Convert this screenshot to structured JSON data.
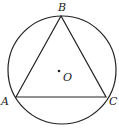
{
  "diagram": {
    "type": "triangle-inscribed-in-circle",
    "circle": {
      "center": "O",
      "cx": 62,
      "cy": 70,
      "r": 54
    },
    "points": [
      {
        "name": "A",
        "x": 16,
        "y": 97,
        "label": "A",
        "lx": 1,
        "ly": 105
      },
      {
        "name": "B",
        "x": 61,
        "y": 16,
        "label": "B",
        "lx": 58,
        "ly": 11
      },
      {
        "name": "C",
        "x": 106,
        "y": 97,
        "label": "C",
        "lx": 109,
        "ly": 105
      }
    ],
    "center_point": {
      "name": "O",
      "x": 59,
      "y": 71,
      "label": "O",
      "lx": 63,
      "ly": 81
    },
    "segments": [
      "AB",
      "BC",
      "CA"
    ],
    "stroke_color": "#222222",
    "background": "#ffffff"
  }
}
